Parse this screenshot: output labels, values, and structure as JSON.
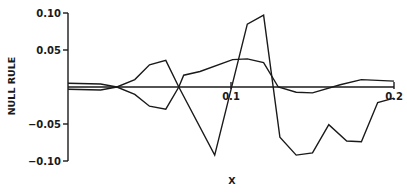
{
  "chart_data": {
    "type": "line",
    "title": "",
    "xlabel": "X",
    "ylabel": "NULL RULE",
    "xlim": [
      0,
      0.2
    ],
    "ylim": [
      -0.1,
      0.1
    ],
    "grid": false,
    "legend": null,
    "x_ticks": [
      {
        "value": 0.1,
        "label": "0.1"
      },
      {
        "value": 0.2,
        "label": "0.2"
      }
    ],
    "y_ticks": [
      {
        "value": 0.1,
        "label": "0.10"
      },
      {
        "value": 0.05,
        "label": "0.05"
      },
      {
        "value": -0.05,
        "label": "−0.05"
      },
      {
        "value": -0.1,
        "label": "−0.10"
      }
    ],
    "x_axis_at_y": 0,
    "series": [
      {
        "name": "curve-a",
        "color": "#1a1a1a",
        "x": [
          0.0,
          0.02,
          0.03,
          0.041,
          0.05,
          0.06,
          0.068,
          0.09,
          0.11,
          0.12,
          0.13,
          0.14,
          0.15,
          0.16,
          0.171,
          0.18,
          0.19,
          0.2
        ],
        "y": [
          0.005,
          0.004,
          0.0,
          0.01,
          0.03,
          0.036,
          0.0,
          -0.092,
          0.085,
          0.097,
          -0.068,
          -0.092,
          -0.089,
          -0.051,
          -0.073,
          -0.074,
          -0.021,
          -0.015
        ]
      },
      {
        "name": "curve-b",
        "color": "#1a1a1a",
        "x": [
          0.0,
          0.02,
          0.03,
          0.041,
          0.05,
          0.06,
          0.068,
          0.071,
          0.081,
          0.101,
          0.11,
          0.12,
          0.129,
          0.14,
          0.15,
          0.167,
          0.18,
          0.2
        ],
        "y": [
          -0.003,
          -0.004,
          0.0,
          -0.01,
          -0.026,
          -0.03,
          0.0,
          0.016,
          0.021,
          0.037,
          0.038,
          0.033,
          0.0,
          -0.007,
          -0.008,
          0.003,
          0.01,
          0.008
        ]
      }
    ]
  }
}
